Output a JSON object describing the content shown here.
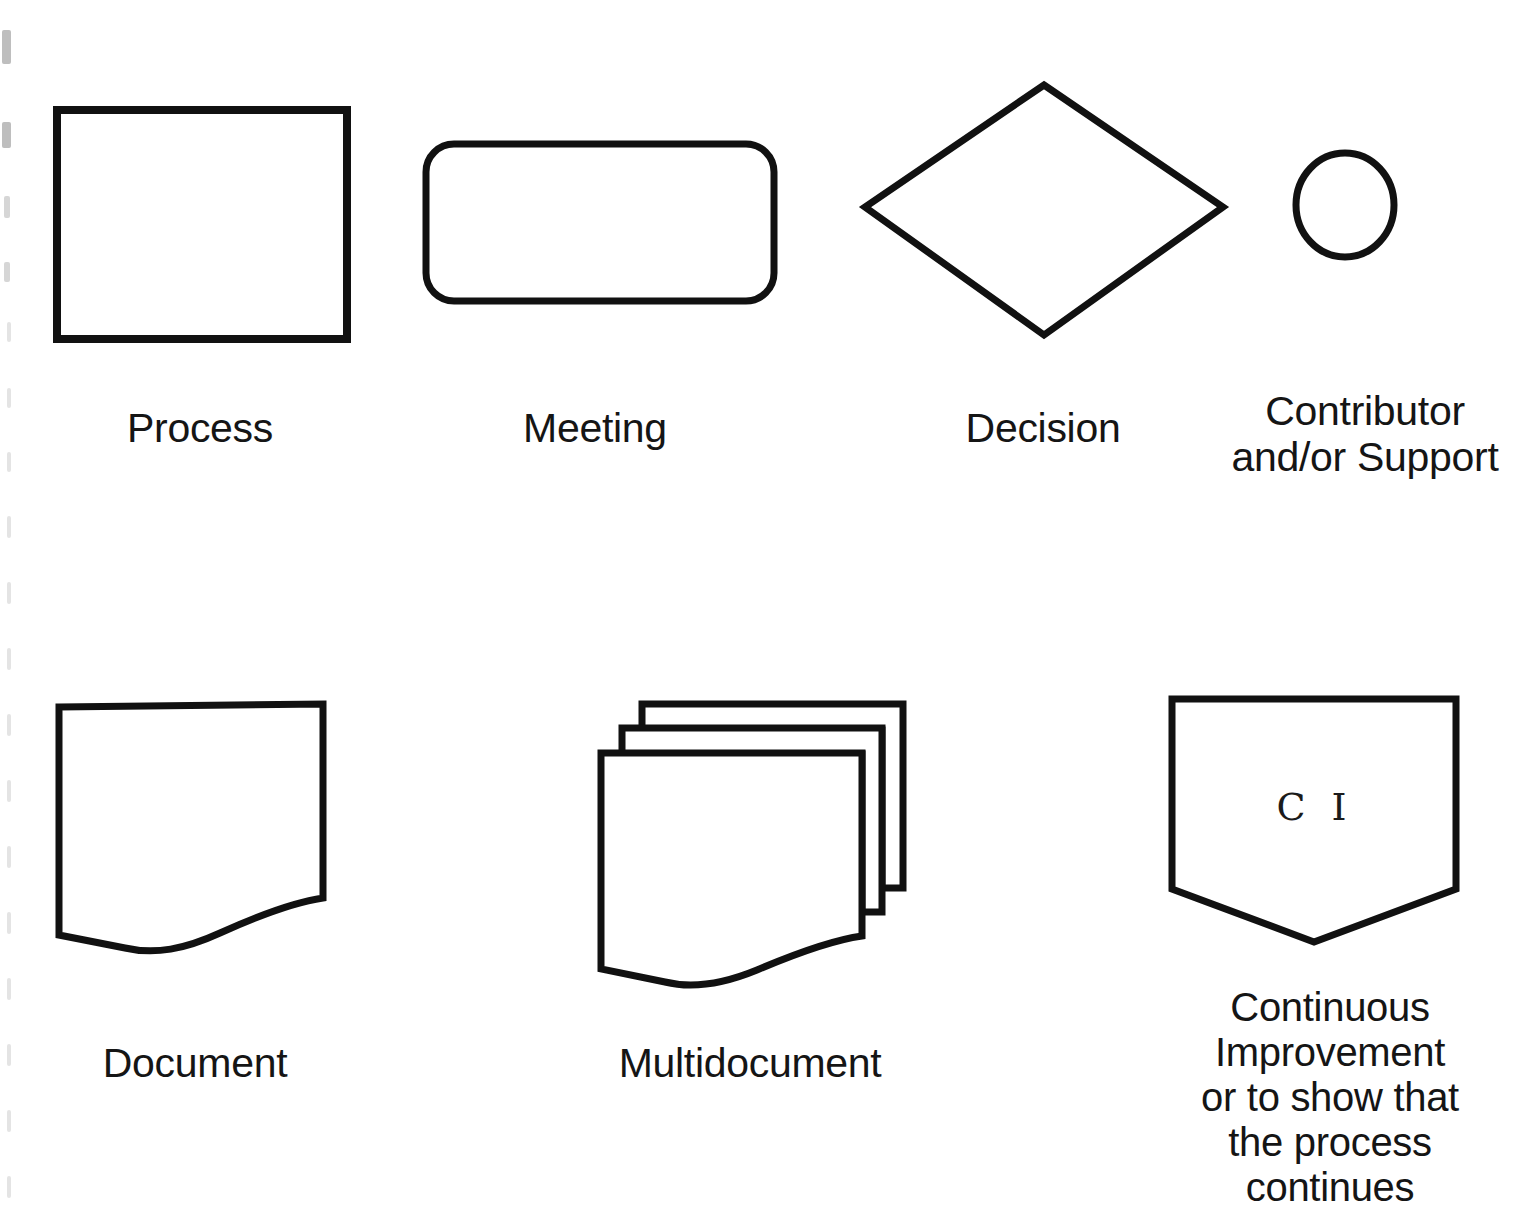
{
  "page": {
    "background_color": "#ffffff",
    "stroke_color": "#111111",
    "text_color": "#151515"
  },
  "symbols": [
    {
      "id": "process",
      "shape": "rectangle",
      "label": "Process",
      "inner_text": ""
    },
    {
      "id": "meeting",
      "shape": "rounded-rectangle",
      "label": "Meeting",
      "inner_text": ""
    },
    {
      "id": "decision",
      "shape": "diamond",
      "label": "Decision",
      "inner_text": ""
    },
    {
      "id": "contributor",
      "shape": "circle",
      "label": "Contributor\nand/or Support",
      "inner_text": ""
    },
    {
      "id": "document",
      "shape": "document",
      "label": "Document",
      "inner_text": ""
    },
    {
      "id": "multidocument",
      "shape": "multidocument",
      "label": "Multidocument",
      "inner_text": ""
    },
    {
      "id": "continuous-improvement",
      "shape": "pentagon-down",
      "label": "Continuous\nImprovement\nor to show that\nthe process\ncontinues",
      "inner_text": "C I"
    }
  ]
}
